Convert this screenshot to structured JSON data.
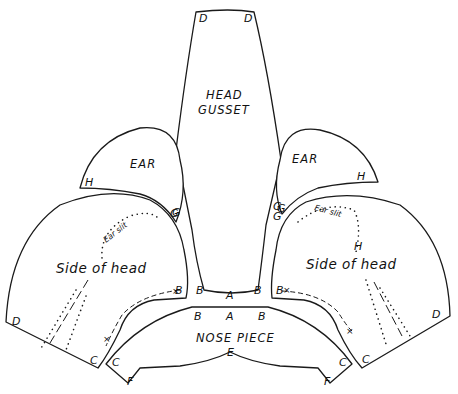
{
  "diagram": {
    "type": "sewing-pattern",
    "pieces": {
      "head_gusset": {
        "title_line1": "HEAD",
        "title_line2": "GUSSET",
        "labels": [
          "D",
          "D",
          "A",
          "B",
          "B",
          "G",
          "G"
        ]
      },
      "ear_left": {
        "title": "EAR",
        "labels": [
          "H",
          "G"
        ]
      },
      "ear_right": {
        "title": "EAR",
        "labels": [
          "H",
          "G"
        ]
      },
      "side_left": {
        "title": "Side of head",
        "ear_slit": "Ear slit",
        "labels": [
          "D",
          "C",
          "B",
          "G"
        ]
      },
      "side_right": {
        "title": "Side of head",
        "ear_slit": "Ear slit",
        "labels": [
          "D",
          "C",
          "B",
          "G",
          "H"
        ]
      },
      "nose_piece": {
        "title": "NOSE PIECE",
        "labels": [
          "B",
          "A",
          "B",
          "C",
          "C",
          "E",
          "F",
          "F"
        ]
      }
    },
    "markers": {
      "cross": "×"
    }
  }
}
